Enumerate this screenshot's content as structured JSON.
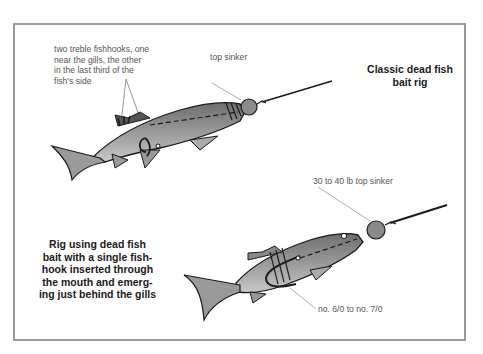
{
  "diagram": {
    "top": {
      "title": "Classic dead fish bait rig",
      "title_lines": [
        "Classic dead fish",
        "bait rig"
      ],
      "hooks_label_lines": [
        "two treble fishhooks, one",
        "near the gills, the other",
        "in the last third of the",
        "fish's side"
      ],
      "sinker_label": "top sinker"
    },
    "bottom": {
      "title_lines": [
        "Rig using dead fish",
        "bait with a single fish-",
        "hook inserted through",
        "the mouth and emerg-",
        "ing just behind the gills"
      ],
      "sinker_label": "30 to 40 lb top sinker",
      "hook_label": "no. 6/0 to no. 7/0"
    },
    "colors": {
      "border": "#9a9a9a",
      "fish_fill": "#8c8c8c",
      "outline": "#1a1a1a",
      "label_text": "#555555",
      "title_text": "#1a1a1a"
    }
  }
}
